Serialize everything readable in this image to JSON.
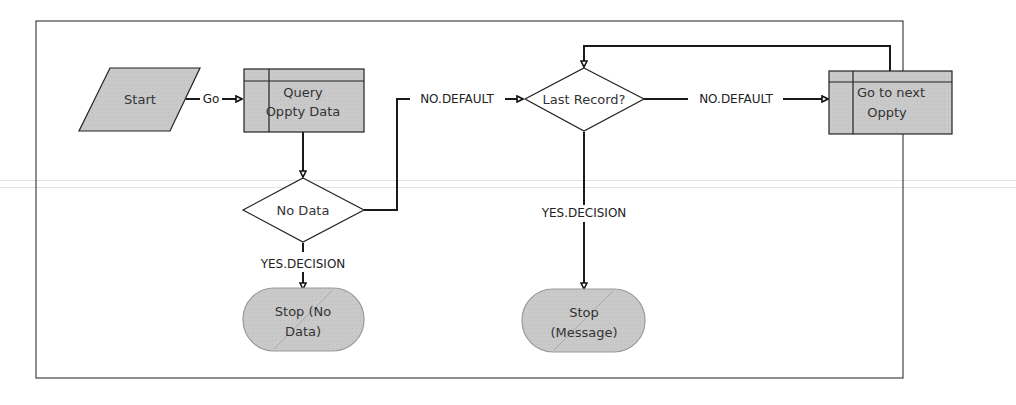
{
  "diagram": {
    "type": "flowchart",
    "nodes": [
      {
        "id": "start",
        "shape": "parallelogram",
        "lines": [
          "Start"
        ]
      },
      {
        "id": "query",
        "shape": "subprocess",
        "lines": [
          "Query",
          "Oppty Data"
        ]
      },
      {
        "id": "nodata",
        "shape": "decision",
        "lines": [
          "No Data"
        ]
      },
      {
        "id": "stop_nodata",
        "shape": "terminator",
        "lines": [
          "Stop (No",
          "Data)"
        ]
      },
      {
        "id": "lastrecord",
        "shape": "decision",
        "lines": [
          "Last Record?"
        ]
      },
      {
        "id": "stop_message",
        "shape": "terminator",
        "lines": [
          "Stop",
          "(Message)"
        ]
      },
      {
        "id": "nextoppty",
        "shape": "subprocess",
        "lines": [
          "Go to next",
          "Oppty"
        ]
      }
    ],
    "edges": [
      {
        "from": "start",
        "to": "query",
        "label": "Go"
      },
      {
        "from": "query",
        "to": "nodata",
        "label": ""
      },
      {
        "from": "nodata",
        "to": "stop_nodata",
        "label": "YES.DECISION"
      },
      {
        "from": "nodata",
        "to": "lastrecord",
        "label": "NO.DEFAULT"
      },
      {
        "from": "lastrecord",
        "to": "nextoppty",
        "label": "NO.DEFAULT"
      },
      {
        "from": "lastrecord",
        "to": "stop_message",
        "label": "YES.DECISION"
      },
      {
        "from": "nextoppty",
        "to": "lastrecord",
        "label": ""
      }
    ],
    "colors": {
      "shape_fill": "#c8c8c8",
      "line": "#1a1a1a",
      "frame": "#444444"
    }
  }
}
